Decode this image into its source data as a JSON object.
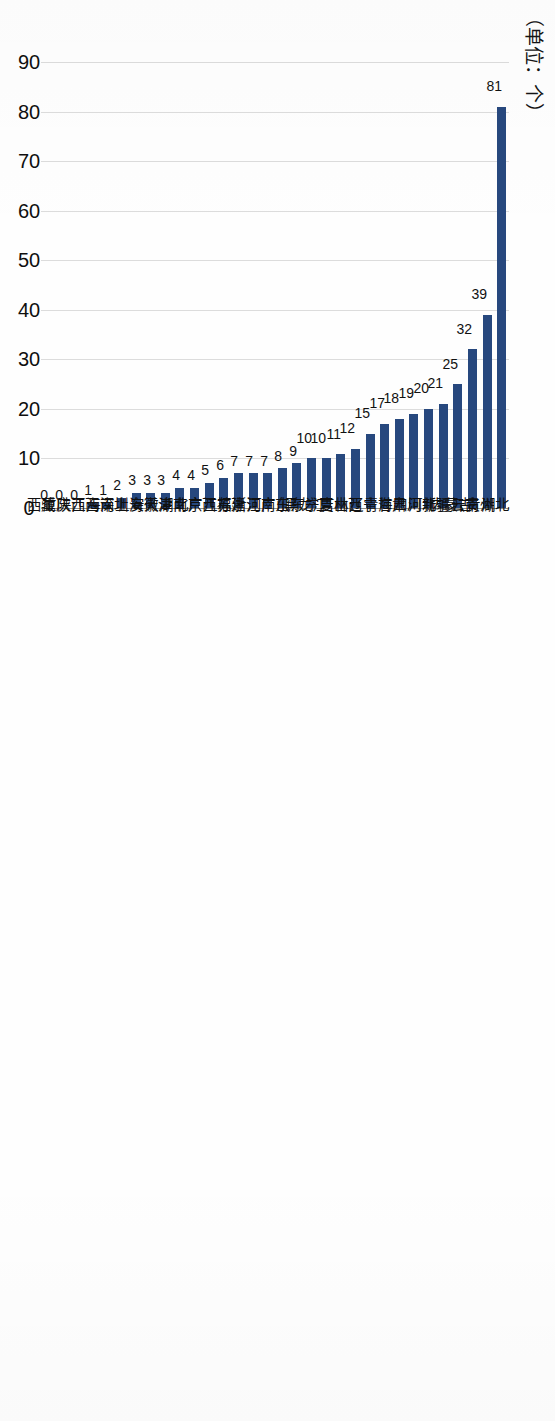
{
  "unit_caption": "（单位：个）",
  "colors": {
    "bar": "#27487e",
    "gridline": "#dcdcdc",
    "axis": "#8e8e8e",
    "text": "#101010",
    "background": "#ffffff"
  },
  "chart_data": {
    "type": "bar",
    "orientation": "horizontal",
    "title": "",
    "subtitle": "",
    "xlabel": "",
    "ylabel": "（单位：个）",
    "unit": "个",
    "grid": true,
    "legend": false,
    "legend_position": "none",
    "xlim": [
      0,
      90
    ],
    "ticks": [
      0,
      10,
      20,
      30,
      40,
      50,
      60,
      70,
      80,
      90
    ],
    "tick_labels": [
      "0",
      "10",
      "20",
      "30",
      "40",
      "50",
      "60",
      "70",
      "80",
      "90"
    ],
    "categories": [
      "湖北",
      "贵州",
      "云南",
      "内蒙古",
      "新疆",
      "河北",
      "四川",
      "甘肃",
      "青海",
      "辽宁",
      "山西",
      "吉林",
      "宁夏",
      "黑龙江",
      "山东",
      "广东",
      "河南",
      "浙江",
      "福建",
      "江苏",
      "广西",
      "北京",
      "湖南",
      "天津",
      "安徽",
      "上海",
      "深圳",
      "海南",
      "江西",
      "陕西",
      "重庆",
      "西藏"
    ],
    "values": [
      81,
      39,
      32,
      25,
      21,
      20,
      19,
      18,
      17,
      15,
      12,
      11,
      10,
      10,
      9,
      8,
      7,
      7,
      7,
      6,
      5,
      4,
      4,
      3,
      3,
      3,
      2,
      1,
      1,
      0,
      0,
      0
    ],
    "data_labels": [
      "81",
      "39",
      "32",
      "25",
      "21",
      "20",
      "19",
      "18",
      "17",
      "15",
      "12",
      "11",
      "10",
      "10",
      "9",
      "8",
      "7",
      "7",
      "7",
      "6",
      "5",
      "4",
      "4",
      "3",
      "3",
      "3",
      "2",
      "1",
      "1",
      "0",
      "0",
      "0"
    ]
  }
}
